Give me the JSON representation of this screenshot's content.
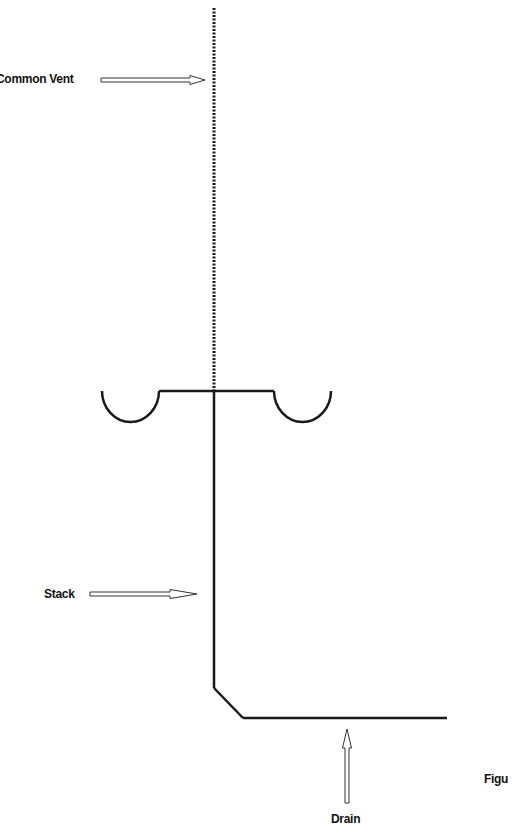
{
  "labels": {
    "common_vent": "Common Vent",
    "stack": "Stack",
    "drain": "Drain",
    "figure": "Figu"
  },
  "colors": {
    "line": "#1a1a1a",
    "background": "#ffffff"
  },
  "diagram": {
    "vent_line": {
      "x": 214,
      "y_top": 8,
      "y_bottom": 391,
      "style": "dotted"
    },
    "stack_line": {
      "x": 214,
      "y_top": 391,
      "y_bottom": 688
    },
    "drain_line": {
      "x_start": 243,
      "x_end": 447,
      "y": 718
    },
    "fixture_bar": {
      "x_start": 159,
      "x_end": 274,
      "y": 391
    },
    "basins": [
      {
        "name": "left",
        "x_start": 102,
        "x_end": 159,
        "y_top": 391,
        "y_bottom": 422
      },
      {
        "name": "right",
        "x_start": 274,
        "x_end": 331,
        "y_top": 391,
        "y_bottom": 422
      }
    ]
  }
}
